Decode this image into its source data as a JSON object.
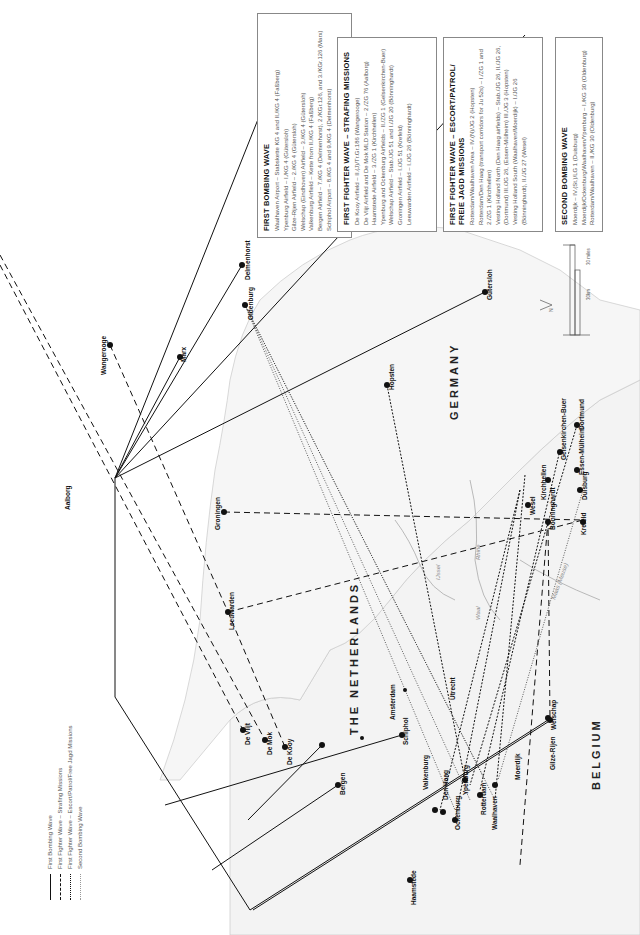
{
  "legend": {
    "items": [
      {
        "label": "First Bombing Wave",
        "style": "solid"
      },
      {
        "label": "First Fighter Wave – Strafing Missions",
        "style": "dashed"
      },
      {
        "label": "First Fighter Wave – Escort/Patrol/Free Jagd Missions",
        "style": "dense-dashed"
      },
      {
        "label": "Second Bombing Wave",
        "style": "dotted"
      }
    ]
  },
  "boxes": {
    "first_bombing": {
      "title": "FIRST BOMBING WAVE",
      "lines": [
        "Waalhaven Airport – Stabskette KG 4 and II./KG 4 (Faßberg)",
        "Ypenburg Airfield – I./KG 4 (Gütersloh)",
        "Gilze-Rijen Airfield – 2./KG 4 (Gütersloh)",
        "Welschap (Eindhoven) Airfield – 3./KG 4 (Gütersloh)",
        "Valkenburg Airfield – Kette from II./KG 4 (Faßberg)",
        "Bergen Airfield – 7./KG 4 (Delmenhorst), 2./KGr.126, and 3./KGr.126 (Marx)",
        "Schiphol Airport – 8./KG 4 and 9./KG 4 (Delmenhorst)"
      ]
    },
    "strafing": {
      "title": "FIRST FIGHTER WAVE – STRAFING MISSIONS",
      "lines": [
        "De Kooy Airfield – II.(J)/Tr.Gr.186 (Wangerooge)",
        "De Vlijt Airfield and De Mok MLD Station – 2./ZG 76 (Aalborg)",
        "Haamstede Airfield – 3./ZG 1 (Kirchhellen)",
        "Ypenburg and Ockenburg Airfields – II./ZG 1 (Gelsenkirchen-Buer)",
        "Welschap Airfield – Stab./JG 51 and I./JG 20 (Bönninghardt)",
        "Groningen Airfield – I./JG 51 (Krefeld)",
        "Leeuwarden Airfield – I./JG 26 (Bönninghardt)"
      ]
    },
    "escort": {
      "title": "FIRST FIGHTER WAVE – ESCORT/PATROL/",
      "title2": "FREIE JAGD MISSIONS",
      "lines": [
        "Rotterdam/Waalhaven Area – IV.(N)/JG 2 (Hopsten)",
        "Rotterdam/Den Haag (transport corridors for Ju 52s) – I./ZG 1 and",
        "   2./ZG 1 (Kirchhellen)",
        "Vesting Holland North (Den Haag airfields) – Stab./JG 26, II./JG 26,",
        "   (Dortmund) III./JG 26, (Essen-Mülheim) III./JG 3 (Hopsten)",
        "Vesting Holland South (Waalhaven/Moerdijk) – I./JG 26",
        "   (Bönninghardt), II./JG 27 (Wesel)"
      ]
    },
    "second_bombing": {
      "title": "SECOND BOMBING WAVE",
      "lines": [
        "Moerdijk – IV.(St.)/LG 1 (Duisburg)",
        "Moerdijk/Ockenburg/Waalhaven/Ypenburg – I./KG 30 (Oldenburg)",
        "Rotterdam/Waalhaven – II./KG 30 (Oldenburg)"
      ]
    }
  },
  "countries": {
    "netherlands": "THE NETHERLANDS",
    "germany": "GERMANY",
    "belgium": "BELGIUM"
  },
  "rivers": {
    "ijssel": "IJssel",
    "rhine": "Rhine",
    "waal": "Waal",
    "maas": "Maas (Meuse)"
  },
  "scale": {
    "miles": "30 miles",
    "km": "30km",
    "zero_top": "0",
    "zero_bottom": "0",
    "north": "N"
  },
  "cities": {
    "aalborg": "Aalborg",
    "fassberg": "Faßberg",
    "delmenhorst": "Delmenhorst",
    "oldenburg": "Oldenburg",
    "marx": "Marx",
    "wangerooge": "Wangerooge",
    "gutersloh": "Gütersloh",
    "hopsten": "Hopsten",
    "dortmund": "Dortmund",
    "essen": "Essen-Mülheim",
    "gelsenkirchen": "Gelsenkirchen-Buer",
    "kirchhellen": "Kirchhellen",
    "wesel": "Wesel",
    "bonninghardt": "Bönninghardt",
    "duisburg": "Duisburg",
    "krefeld": "Krefeld",
    "groningen": "Groningen",
    "leeuwarden": "Leeuwarden",
    "welschap": "Welschap",
    "gilze": "Gilze-Rijen",
    "moerdijk": "Moerdijk",
    "waalhaven": "Waalhaven",
    "rotterdam": "Rotterdam",
    "ypenburg": "Ypenburg",
    "ockenburg": "Ockenburg",
    "denhaag": "Den Haag",
    "valkenburg": "Valkenburg",
    "schiphol": "Schiphol",
    "amsterdam": "Amsterdam",
    "utrecht": "Utrecht",
    "bergen": "Bergen",
    "dekooy": "De Kooy",
    "demok": "De Mok",
    "devlijt": "De Vlijt",
    "haamstede": "Haamstede"
  }
}
